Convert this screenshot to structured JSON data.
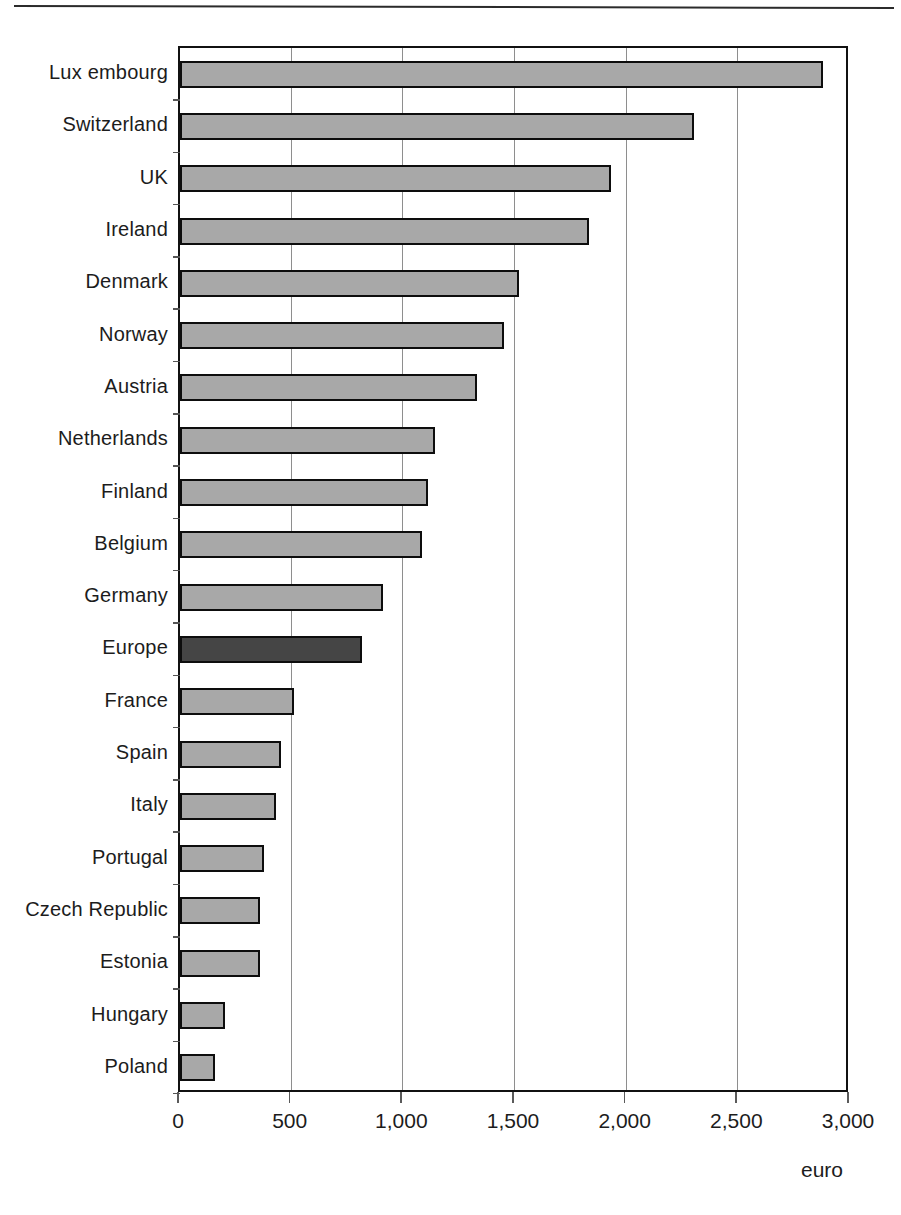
{
  "figure": {
    "unit_label": "euro",
    "bar_color": "#a8a8a8",
    "highlight_color": "#454545",
    "border_color": "#0d0d0d",
    "grid_color": "#8e8e8e"
  },
  "chart_data": {
    "type": "bar",
    "orientation": "horizontal",
    "title": "",
    "subtitle": "",
    "xlabel": "euro",
    "ylabel": "",
    "xlim": [
      0,
      3000
    ],
    "xticks": [
      0,
      500,
      1000,
      1500,
      2000,
      2500,
      3000
    ],
    "xtick_labels": [
      "0",
      "500",
      "1,000",
      "1,500",
      "2,000",
      "2,500",
      "3,000"
    ],
    "grid": true,
    "grid_axis": "x",
    "legend": null,
    "highlight_category": "Europe",
    "categories": [
      "Lux embourg",
      "Switzerland",
      "UK",
      "Ireland",
      "Denmark",
      "Norway",
      "Austria",
      "Netherlands",
      "Finland",
      "Belgium",
      "Germany",
      "Europe",
      "France",
      "Spain",
      "Italy",
      "Portugal",
      "Czech Republic",
      "Estonia",
      "Hungary",
      "Poland"
    ],
    "values": [
      2880,
      2300,
      1930,
      1830,
      1520,
      1450,
      1330,
      1140,
      1110,
      1085,
      910,
      815,
      510,
      450,
      430,
      375,
      360,
      360,
      200,
      155
    ]
  }
}
